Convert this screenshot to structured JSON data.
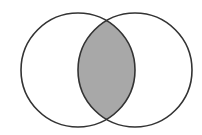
{
  "diagram": {
    "type": "venn",
    "sets": [
      {
        "id": "A",
        "cx": 78,
        "cy": 70,
        "r": 57
      },
      {
        "id": "B",
        "cx": 135,
        "cy": 70,
        "r": 57
      }
    ],
    "highlighted_region": "A∩B",
    "colors": {
      "background": "#ffffff",
      "stroke": "#333333",
      "intersection_fill": "#a8a8a8"
    },
    "stroke_width": 1.6
  }
}
